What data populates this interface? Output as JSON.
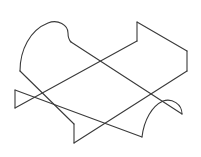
{
  "diagram": {
    "type": "isometric-line-drawing",
    "stroke_color": "#3a3a3a",
    "background": "#ffffff",
    "stroke_width": 1.1,
    "paths": [
      {
        "name": "left-arc-edge",
        "d": "M 20 71 C 20 50, 30 30, 48 23 C 58 19, 68 25, 68 33 C 68 38, 69 40, 71 42"
      },
      {
        "name": "left-arc-to-bottom-step",
        "d": "M 20 71 L 74 124"
      },
      {
        "name": "bottom-step-vertical",
        "d": "M 74 124 L 74 143"
      },
      {
        "name": "bottom-step-to-right",
        "d": "M 74 143 L 187 71"
      },
      {
        "name": "right-step-vertical",
        "d": "M 187 71 L 187 51"
      },
      {
        "name": "right-top-edge",
        "d": "M 187 51 L 137 22"
      },
      {
        "name": "top-step-vertical",
        "d": "M 137 22 L 137 41"
      },
      {
        "name": "top-step-to-left-triangle",
        "d": "M 137 41 L 15 108"
      },
      {
        "name": "left-triangle-vertical",
        "d": "M 15 108 L 15 90"
      },
      {
        "name": "left-triangle-to-right-arc",
        "d": "M 15 90 L 142 137"
      },
      {
        "name": "right-arc-edge",
        "d": "M 142 137 C 144 120, 152 106, 163 101 C 172 98, 182 104, 182 114"
      },
      {
        "name": "right-arc-to-left-arc",
        "d": "M 182 114 L 71 42"
      }
    ]
  }
}
